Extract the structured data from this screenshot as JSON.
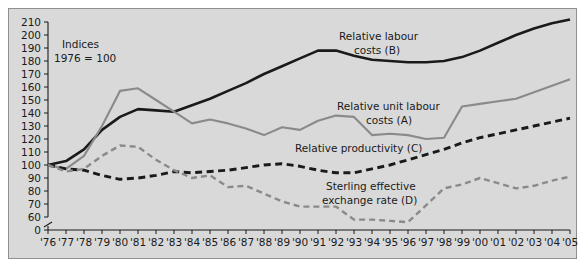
{
  "chart_data": {
    "type": "line",
    "title": "",
    "subtitle": "",
    "xlabel": "",
    "ylabel": "",
    "note_line1": "Indices",
    "note_line2": "1976 = 100",
    "grid": false,
    "legend_position": "inline-annotations",
    "axis_break_at_zero": true,
    "xlim": [
      1976,
      2005
    ],
    "ylim": [
      60,
      210
    ],
    "y_ticks": [
      0,
      60,
      70,
      80,
      90,
      100,
      110,
      120,
      130,
      140,
      150,
      160,
      170,
      180,
      190,
      200,
      210
    ],
    "y_tick_labels": [
      "0",
      "60",
      "70",
      "80",
      "90",
      "100",
      "110",
      "120",
      "130",
      "140",
      "150",
      "160",
      "170",
      "180",
      "190",
      "200",
      "210"
    ],
    "x": [
      1976,
      1977,
      1978,
      1979,
      1980,
      1981,
      1982,
      1983,
      1984,
      1985,
      1986,
      1987,
      1988,
      1989,
      1990,
      1991,
      1992,
      1993,
      1994,
      1995,
      1996,
      1997,
      1998,
      1999,
      2000,
      2001,
      2002,
      2003,
      2004,
      2005
    ],
    "x_tick_labels": [
      "'76",
      "'77",
      "'78",
      "'79",
      "'80",
      "'81",
      "'82",
      "'83",
      "'84",
      "'85",
      "'86",
      "'87",
      "'88",
      "'89",
      "'90",
      "'91",
      "'92",
      "'93",
      "'94",
      "'95",
      "'96",
      "'97",
      "'98",
      "'99",
      "'00",
      "'01",
      "'02",
      "'03",
      "'04",
      "'05"
    ],
    "series": [
      {
        "name": "Relative labour costs (B)",
        "label_line1": "Relative labour",
        "label_line2": "costs (B)",
        "key": "B",
        "color": "#1a1a1a",
        "style": "solid",
        "width": 2.6,
        "values": [
          100,
          103,
          112,
          127,
          137,
          143,
          142,
          141,
          146,
          151,
          157,
          163,
          170,
          176,
          182,
          188,
          188,
          184,
          181,
          180,
          179,
          179,
          180,
          183,
          188,
          194,
          200,
          205,
          209,
          212
        ]
      },
      {
        "name": "Relative unit labour costs (A)",
        "label_line1": "Relative unit labour",
        "label_line2": "costs (A)",
        "key": "A",
        "color": "#8a8a8a",
        "style": "solid",
        "width": 2.1,
        "values": [
          100,
          97,
          107,
          130,
          157,
          159,
          150,
          141,
          132,
          135,
          132,
          128,
          123,
          129,
          127,
          134,
          138,
          137,
          123,
          124,
          123,
          120,
          121,
          145,
          147,
          149,
          151,
          156,
          161,
          166
        ]
      },
      {
        "name": "Relative productivity (C)",
        "label_line1": "Relative productivity (C)",
        "label_line2": "",
        "key": "C",
        "color": "#1a1a1a",
        "style": "dashed",
        "width": 2.9,
        "values": [
          100,
          97,
          96,
          92,
          89,
          90,
          92,
          95,
          94,
          95,
          96,
          98,
          100,
          101,
          99,
          96,
          94,
          94,
          97,
          100,
          104,
          108,
          112,
          117,
          121,
          124,
          127,
          130,
          133,
          136
        ]
      },
      {
        "name": "Sterling effective exchange rate (D)",
        "label_line1": "Sterling effective",
        "label_line2": "exchange rate (D)",
        "key": "D",
        "color": "#8a8a8a",
        "style": "dashed",
        "width": 2.4,
        "values": [
          100,
          95,
          97,
          107,
          115,
          114,
          104,
          96,
          90,
          92,
          83,
          84,
          78,
          72,
          68,
          68,
          68,
          58,
          58,
          57,
          56,
          69,
          82,
          85,
          90,
          86,
          82,
          84,
          88,
          91
        ]
      }
    ]
  }
}
